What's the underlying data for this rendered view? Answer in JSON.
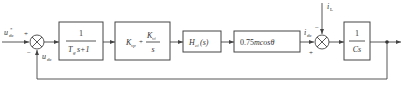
{
  "diagram": {
    "type": "control-block-diagram",
    "input": {
      "label_main": "u",
      "label_sub": "dc",
      "label_sup": "*"
    },
    "feedback_label": {
      "main": "u",
      "sub": "dc"
    },
    "disturbance_label": {
      "main": "i",
      "sub": "L"
    },
    "current_label": {
      "main": "i",
      "sub": "dc"
    },
    "sum1": {
      "plus": "+",
      "minus": "−"
    },
    "sum2": {
      "plus": "+",
      "minus": "−"
    },
    "blocks": [
      {
        "id": "lowpass",
        "numerator": "1",
        "den_main": "T",
        "den_sub": "g",
        "den_rest": "s+1"
      },
      {
        "id": "pi-controller",
        "kp_main": "K",
        "kp_sub": "vp",
        "plus": "+",
        "ki_main": "K",
        "ki_sub": "vi",
        "ki_den": "s"
      },
      {
        "id": "current-loop",
        "main": "H",
        "sub": "ci",
        "rest": "(s)"
      },
      {
        "id": "modulation-gain",
        "text": "0.75",
        "text_it": "mcosθ"
      },
      {
        "id": "capacitor",
        "numerator": "1",
        "denominator": "Cs"
      }
    ]
  },
  "colors": {
    "line": "#444444",
    "text": "#333333",
    "background": "#ffffff"
  }
}
